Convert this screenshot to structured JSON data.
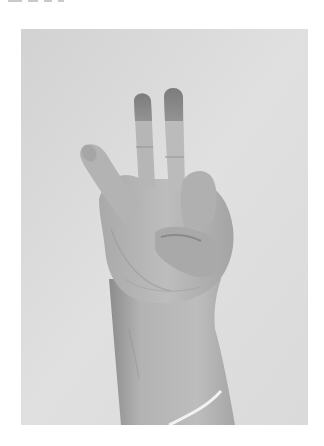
{
  "image": {
    "subject": "hand gesture",
    "description": "Grayscale photograph of a raised right hand with index and middle fingers extended upward, thumb extended outward to the left, ring and little fingers folded against the palm, wrist and forearm extending to the bottom edge",
    "style": "grayscale photo",
    "frame": {
      "x": 21,
      "y": 29,
      "width": 287,
      "height": 396
    },
    "colors": {
      "page_background": "#ffffff",
      "photo_background": "#d6d6d6",
      "photo_background_light": "#e2e2e2",
      "skin_tone": "#b5b5b5",
      "skin_shadow": "#8f8f8f",
      "skin_highlight": "#c9c9c9",
      "fingertip_dark": "#7a7a7a",
      "sleeve_edge": "#f0f0f0"
    }
  }
}
